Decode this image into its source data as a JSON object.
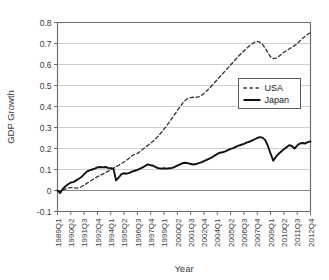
{
  "chart_data": {
    "type": "line",
    "title": "",
    "xlabel": "Year",
    "ylabel": "GDP Growth",
    "grid": true,
    "legend_position": "right-upper-inside",
    "ylim": [
      -0.1,
      0.8
    ],
    "yticks": [
      -0.1,
      0,
      0.1,
      0.2,
      0.3,
      0.4,
      0.5,
      0.6,
      0.7,
      0.8
    ],
    "ytick_labels": [
      "-0.1",
      "0",
      "0.1",
      "0.2",
      "0.3",
      "0.4",
      "0.5",
      "0.6",
      "0.7",
      "0.8"
    ],
    "xtick_labels": [
      "1989Q1",
      "1990Q2",
      "1991Q3",
      "1992Q4",
      "1994Q1",
      "1995Q2",
      "1996Q3",
      "1997Q4",
      "1999Q1",
      "2000Q2",
      "2001Q3",
      "2002Q4",
      "2004Q1",
      "2005Q2",
      "2006Q3",
      "2007Q4",
      "2009Q1",
      "2010Q2",
      "2011Q3",
      "2012Q4"
    ],
    "x_tick_step_quarters": 5,
    "x": [
      "1989Q1",
      "1989Q2",
      "1989Q3",
      "1989Q4",
      "1990Q1",
      "1990Q2",
      "1990Q3",
      "1990Q4",
      "1991Q1",
      "1991Q2",
      "1991Q3",
      "1991Q4",
      "1992Q1",
      "1992Q2",
      "1992Q3",
      "1992Q4",
      "1993Q1",
      "1993Q2",
      "1993Q3",
      "1993Q4",
      "1994Q1",
      "1994Q2",
      "1994Q3",
      "1994Q4",
      "1995Q1",
      "1995Q2",
      "1995Q3",
      "1995Q4",
      "1996Q1",
      "1996Q2",
      "1996Q3",
      "1996Q4",
      "1997Q1",
      "1997Q2",
      "1997Q3",
      "1997Q4",
      "1998Q1",
      "1998Q2",
      "1998Q3",
      "1998Q4",
      "1999Q1",
      "1999Q2",
      "1999Q3",
      "1999Q4",
      "2000Q1",
      "2000Q2",
      "2000Q3",
      "2000Q4",
      "2001Q1",
      "2001Q2",
      "2001Q3",
      "2001Q4",
      "2002Q1",
      "2002Q2",
      "2002Q3",
      "2002Q4",
      "2003Q1",
      "2003Q2",
      "2003Q3",
      "2003Q4",
      "2004Q1",
      "2004Q2",
      "2004Q3",
      "2004Q4",
      "2005Q1",
      "2005Q2",
      "2005Q3",
      "2005Q4",
      "2006Q1",
      "2006Q2",
      "2006Q3",
      "2006Q4",
      "2007Q1",
      "2007Q2",
      "2007Q3",
      "2007Q4",
      "2008Q1",
      "2008Q2",
      "2008Q3",
      "2008Q4",
      "2009Q1",
      "2009Q2",
      "2009Q3",
      "2009Q4",
      "2010Q1",
      "2010Q2",
      "2010Q3",
      "2010Q4",
      "2011Q1",
      "2011Q2",
      "2011Q3",
      "2011Q4",
      "2012Q1",
      "2012Q2",
      "2012Q3",
      "2012Q4"
    ],
    "series": [
      {
        "name": "USA",
        "style": "dashed",
        "color": "#333333",
        "values": [
          0.0,
          -0.004,
          0.002,
          0.008,
          0.012,
          0.014,
          0.013,
          0.011,
          0.012,
          0.018,
          0.026,
          0.034,
          0.042,
          0.05,
          0.058,
          0.066,
          0.072,
          0.078,
          0.085,
          0.092,
          0.1,
          0.106,
          0.113,
          0.12,
          0.128,
          0.136,
          0.145,
          0.155,
          0.166,
          0.172,
          0.176,
          0.186,
          0.196,
          0.206,
          0.216,
          0.226,
          0.236,
          0.248,
          0.262,
          0.276,
          0.292,
          0.308,
          0.326,
          0.344,
          0.362,
          0.38,
          0.398,
          0.416,
          0.43,
          0.438,
          0.442,
          0.444,
          0.444,
          0.446,
          0.452,
          0.462,
          0.474,
          0.486,
          0.5,
          0.514,
          0.528,
          0.542,
          0.556,
          0.57,
          0.584,
          0.598,
          0.612,
          0.626,
          0.64,
          0.652,
          0.664,
          0.676,
          0.688,
          0.698,
          0.706,
          0.71,
          0.706,
          0.696,
          0.678,
          0.656,
          0.636,
          0.628,
          0.63,
          0.638,
          0.648,
          0.658,
          0.666,
          0.674,
          0.682,
          0.69,
          0.7,
          0.712,
          0.724,
          0.734,
          0.744,
          0.752
        ]
      },
      {
        "name": "Japan",
        "style": "solid",
        "color": "#111111",
        "values": [
          0.0,
          -0.012,
          0.008,
          0.02,
          0.03,
          0.038,
          0.04,
          0.048,
          0.056,
          0.064,
          0.078,
          0.09,
          0.096,
          0.1,
          0.104,
          0.11,
          0.112,
          0.11,
          0.112,
          0.108,
          0.106,
          0.104,
          0.048,
          0.062,
          0.078,
          0.082,
          0.08,
          0.084,
          0.09,
          0.094,
          0.098,
          0.104,
          0.11,
          0.118,
          0.124,
          0.12,
          0.118,
          0.11,
          0.106,
          0.104,
          0.106,
          0.104,
          0.106,
          0.108,
          0.112,
          0.118,
          0.124,
          0.13,
          0.132,
          0.13,
          0.126,
          0.124,
          0.126,
          0.13,
          0.134,
          0.14,
          0.146,
          0.152,
          0.158,
          0.166,
          0.174,
          0.18,
          0.182,
          0.186,
          0.192,
          0.198,
          0.202,
          0.208,
          0.214,
          0.218,
          0.222,
          0.228,
          0.232,
          0.238,
          0.244,
          0.25,
          0.254,
          0.252,
          0.24,
          0.212,
          0.176,
          0.142,
          0.16,
          0.174,
          0.186,
          0.196,
          0.206,
          0.216,
          0.212,
          0.2,
          0.214,
          0.224,
          0.226,
          0.224,
          0.23,
          0.234
        ]
      }
    ]
  },
  "legend": {
    "items": [
      {
        "label": "USA",
        "style": "dashed"
      },
      {
        "label": "Japan",
        "style": "solid"
      }
    ]
  }
}
